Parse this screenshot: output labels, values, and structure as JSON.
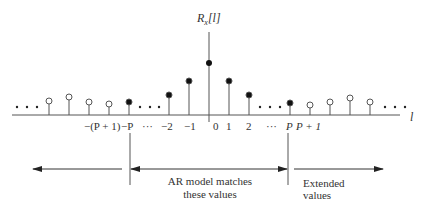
{
  "diagram": {
    "y_axis_label": "R",
    "y_axis_label_sub": "x",
    "y_axis_label_arg": "[l]",
    "x_axis_label": "l",
    "tick_labels": {
      "neg_p_plus_1": "−(P + 1)",
      "neg_p": "−P",
      "neg_dots": "···",
      "neg_2": "−2",
      "neg_1": "−1",
      "zero": "0",
      "pos_1": "1",
      "pos_2": "2",
      "pos_dots": "···",
      "pos_p": "P",
      "pos_p_plus_1": "P + 1"
    },
    "ellipsis": "• • •",
    "regions": {
      "matched_line1": "AR model matches",
      "matched_line2": "these values",
      "extended_line1": "Extended",
      "extended_line2": "values"
    },
    "colors": {
      "line": "#444444",
      "filled": "#111111",
      "text": "#333333"
    }
  }
}
